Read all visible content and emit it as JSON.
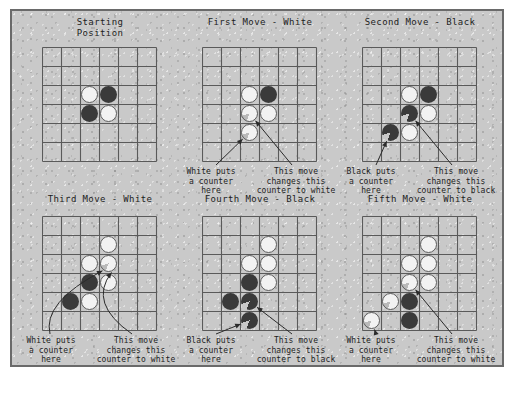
{
  "figure": {
    "kind": "othello-reversi-opening-sequence",
    "background_color": "#c9c9c9",
    "border_color": "#6a6a6a",
    "piece_black_color": "#3a3a3a",
    "piece_white_color": "#f2f2f2",
    "grid_color": "#5a5a5a",
    "board_size": 6
  },
  "captions": {
    "white_place": "White puts\na counter\nhere",
    "white_flip": "This move\nchanges this\ncounter to white",
    "black_place": "Black puts\na counter\nhere",
    "black_flip": "This move\nchanges this\ncounter to black"
  },
  "panels": [
    {
      "id": "starting-position",
      "title": "Starting\nPosition",
      "has_captions": false,
      "arrow_style": "none",
      "pieces": [
        {
          "col": 2,
          "row": 2,
          "color": "white",
          "marked": false
        },
        {
          "col": 3,
          "row": 2,
          "color": "black",
          "marked": false
        },
        {
          "col": 2,
          "row": 3,
          "color": "black",
          "marked": false
        },
        {
          "col": 3,
          "row": 3,
          "color": "white",
          "marked": false
        }
      ]
    },
    {
      "id": "first-move-white",
      "title": "First Move - White",
      "has_captions": true,
      "arrow_style": "straight",
      "caption_left": "white_place",
      "caption_right": "white_flip",
      "pieces": [
        {
          "col": 2,
          "row": 2,
          "color": "white",
          "marked": false
        },
        {
          "col": 3,
          "row": 2,
          "color": "black",
          "marked": false
        },
        {
          "col": 2,
          "row": 3,
          "color": "white",
          "marked": true
        },
        {
          "col": 3,
          "row": 3,
          "color": "white",
          "marked": false
        },
        {
          "col": 2,
          "row": 4,
          "color": "white",
          "marked": true
        }
      ]
    },
    {
      "id": "second-move-black",
      "title": "Second Move - Black",
      "has_captions": true,
      "arrow_style": "straight",
      "caption_left": "black_place",
      "caption_right": "black_flip",
      "pieces": [
        {
          "col": 2,
          "row": 2,
          "color": "white",
          "marked": false
        },
        {
          "col": 3,
          "row": 2,
          "color": "black",
          "marked": false
        },
        {
          "col": 2,
          "row": 3,
          "color": "black",
          "marked": true
        },
        {
          "col": 3,
          "row": 3,
          "color": "white",
          "marked": false
        },
        {
          "col": 1,
          "row": 4,
          "color": "black",
          "marked": true
        },
        {
          "col": 2,
          "row": 4,
          "color": "white",
          "marked": false
        }
      ]
    },
    {
      "id": "third-move-white",
      "title": "Third Move - White",
      "has_captions": true,
      "arrow_style": "curved",
      "caption_left": "white_place",
      "caption_right": "white_flip",
      "pieces": [
        {
          "col": 3,
          "row": 1,
          "color": "white",
          "marked": false
        },
        {
          "col": 2,
          "row": 2,
          "color": "white",
          "marked": false
        },
        {
          "col": 3,
          "row": 2,
          "color": "white",
          "marked": true
        },
        {
          "col": 2,
          "row": 3,
          "color": "black",
          "marked": false
        },
        {
          "col": 3,
          "row": 3,
          "color": "white",
          "marked": false
        },
        {
          "col": 1,
          "row": 4,
          "color": "black",
          "marked": false
        },
        {
          "col": 2,
          "row": 4,
          "color": "white",
          "marked": false
        }
      ]
    },
    {
      "id": "fourth-move-black",
      "title": "Fourth Move - Black",
      "has_captions": true,
      "arrow_style": "straight",
      "caption_left": "black_place",
      "caption_right": "black_flip",
      "pieces": [
        {
          "col": 3,
          "row": 1,
          "color": "white",
          "marked": false
        },
        {
          "col": 2,
          "row": 2,
          "color": "white",
          "marked": false
        },
        {
          "col": 3,
          "row": 2,
          "color": "white",
          "marked": false
        },
        {
          "col": 2,
          "row": 3,
          "color": "black",
          "marked": false
        },
        {
          "col": 3,
          "row": 3,
          "color": "white",
          "marked": false
        },
        {
          "col": 1,
          "row": 4,
          "color": "black",
          "marked": false
        },
        {
          "col": 2,
          "row": 4,
          "color": "black",
          "marked": true
        },
        {
          "col": 2,
          "row": 5,
          "color": "black",
          "marked": true
        }
      ]
    },
    {
      "id": "fifth-move-white",
      "title": "Fifth Move - White",
      "has_captions": true,
      "arrow_style": "straight",
      "caption_left": "white_place",
      "caption_right": "white_flip",
      "pieces": [
        {
          "col": 3,
          "row": 1,
          "color": "white",
          "marked": false
        },
        {
          "col": 2,
          "row": 2,
          "color": "white",
          "marked": false
        },
        {
          "col": 3,
          "row": 2,
          "color": "white",
          "marked": false
        },
        {
          "col": 2,
          "row": 3,
          "color": "white",
          "marked": true
        },
        {
          "col": 3,
          "row": 3,
          "color": "white",
          "marked": false
        },
        {
          "col": 1,
          "row": 4,
          "color": "white",
          "marked": true
        },
        {
          "col": 2,
          "row": 4,
          "color": "black",
          "marked": false
        },
        {
          "col": 0,
          "row": 5,
          "color": "white",
          "marked": true
        },
        {
          "col": 2,
          "row": 5,
          "color": "black",
          "marked": false
        }
      ]
    }
  ]
}
